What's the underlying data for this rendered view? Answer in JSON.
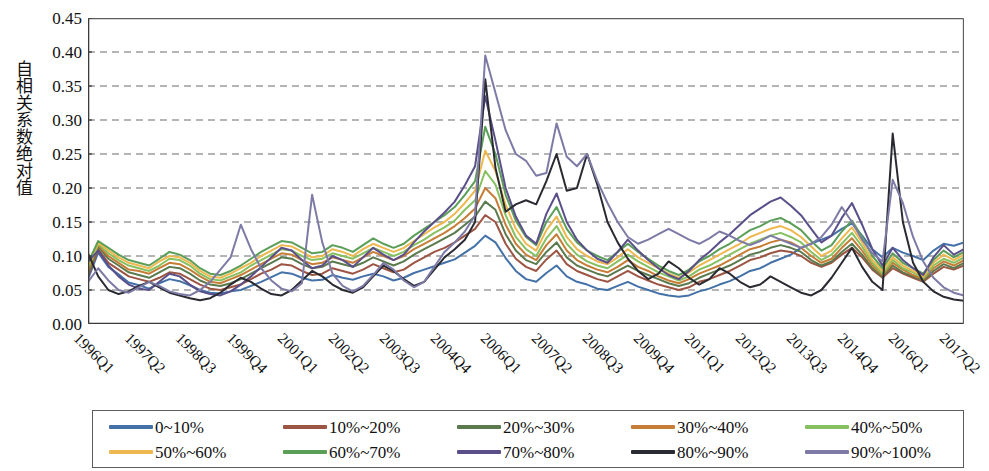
{
  "chart_data": {
    "type": "line",
    "title": "",
    "subtitle": "",
    "xlabel": "",
    "ylabel": "自相关系数绝对值",
    "ylim": [
      0.0,
      0.45
    ],
    "ytick_labels": [
      "0.45",
      "0.40",
      "0.35",
      "0.30",
      "0.25",
      "0.20",
      "0.15",
      "0.10",
      "0.05",
      "0.00"
    ],
    "ytick_values": [
      0.45,
      0.4,
      0.35,
      0.3,
      0.25,
      0.2,
      0.15,
      0.1,
      0.05,
      0.0
    ],
    "grid": "horizontal-dashed",
    "legend_position": "bottom",
    "legend_columns": 5,
    "x_tick_labels": [
      "1996Q1",
      "1997Q2",
      "1998Q3",
      "1999Q4",
      "2001Q1",
      "2002Q2",
      "2003Q3",
      "2004Q4",
      "2006Q1",
      "2007Q2",
      "2008Q3",
      "2009Q4",
      "2011Q1",
      "2012Q2",
      "2013Q3",
      "2014Q4",
      "2016Q1",
      "2017Q2"
    ],
    "x_tick_step_quarters": 5,
    "x_count": 87,
    "x_start": "1996Q1",
    "x_end": "2017Q3",
    "colors": {
      "0~10%": "#4472a8",
      "10%~20%": "#9c5543",
      "20%~30%": "#5a7a4e",
      "30%~40%": "#c67d35",
      "40%~50%": "#86c060",
      "50%~60%": "#eeb84f",
      "60%~70%": "#5a9e57",
      "70%~80%": "#5b4f8a",
      "80%~90%": "#2a2a33",
      "90%~100%": "#7d7ba6"
    },
    "series": [
      {
        "name": "0~10%",
        "color": "#4472a8",
        "values": [
          0.066,
          0.105,
          0.084,
          0.073,
          0.061,
          0.057,
          0.052,
          0.06,
          0.066,
          0.063,
          0.057,
          0.05,
          0.046,
          0.045,
          0.048,
          0.05,
          0.056,
          0.062,
          0.069,
          0.076,
          0.074,
          0.068,
          0.064,
          0.065,
          0.072,
          0.068,
          0.065,
          0.07,
          0.074,
          0.07,
          0.064,
          0.068,
          0.075,
          0.08,
          0.085,
          0.09,
          0.095,
          0.105,
          0.115,
          0.13,
          0.12,
          0.097,
          0.078,
          0.066,
          0.062,
          0.075,
          0.086,
          0.07,
          0.062,
          0.058,
          0.052,
          0.05,
          0.056,
          0.062,
          0.055,
          0.05,
          0.045,
          0.042,
          0.04,
          0.042,
          0.048,
          0.052,
          0.058,
          0.063,
          0.07,
          0.078,
          0.082,
          0.09,
          0.096,
          0.102,
          0.112,
          0.118,
          0.124,
          0.13,
          0.14,
          0.148,
          0.13,
          0.11,
          0.098,
          0.112,
          0.105,
          0.1,
          0.094,
          0.108,
          0.118,
          0.115,
          0.12
        ]
      },
      {
        "name": "10%~20%",
        "color": "#9c5543",
        "values": [
          0.07,
          0.11,
          0.09,
          0.08,
          0.07,
          0.066,
          0.062,
          0.068,
          0.076,
          0.074,
          0.066,
          0.058,
          0.052,
          0.05,
          0.054,
          0.058,
          0.066,
          0.074,
          0.08,
          0.088,
          0.086,
          0.078,
          0.072,
          0.074,
          0.082,
          0.078,
          0.074,
          0.08,
          0.088,
          0.082,
          0.076,
          0.08,
          0.09,
          0.098,
          0.106,
          0.112,
          0.12,
          0.13,
          0.14,
          0.16,
          0.15,
          0.118,
          0.096,
          0.084,
          0.078,
          0.095,
          0.108,
          0.088,
          0.078,
          0.072,
          0.066,
          0.062,
          0.07,
          0.078,
          0.07,
          0.064,
          0.058,
          0.054,
          0.05,
          0.054,
          0.062,
          0.066,
          0.072,
          0.078,
          0.086,
          0.094,
          0.098,
          0.104,
          0.108,
          0.106,
          0.1,
          0.09,
          0.084,
          0.09,
          0.102,
          0.112,
          0.098,
          0.08,
          0.068,
          0.082,
          0.074,
          0.068,
          0.062,
          0.074,
          0.084,
          0.08,
          0.086
        ]
      },
      {
        "name": "20%~30%",
        "color": "#5a7a4e",
        "values": [
          0.074,
          0.114,
          0.096,
          0.086,
          0.076,
          0.072,
          0.068,
          0.076,
          0.084,
          0.082,
          0.074,
          0.064,
          0.058,
          0.056,
          0.06,
          0.066,
          0.074,
          0.082,
          0.09,
          0.098,
          0.096,
          0.088,
          0.082,
          0.084,
          0.092,
          0.088,
          0.084,
          0.09,
          0.098,
          0.092,
          0.086,
          0.092,
          0.102,
          0.11,
          0.118,
          0.126,
          0.134,
          0.146,
          0.158,
          0.18,
          0.168,
          0.132,
          0.108,
          0.094,
          0.088,
          0.106,
          0.12,
          0.098,
          0.086,
          0.08,
          0.074,
          0.07,
          0.078,
          0.086,
          0.078,
          0.072,
          0.066,
          0.06,
          0.056,
          0.06,
          0.068,
          0.074,
          0.08,
          0.086,
          0.094,
          0.102,
          0.106,
          0.112,
          0.116,
          0.112,
          0.106,
          0.094,
          0.086,
          0.092,
          0.106,
          0.118,
          0.102,
          0.082,
          0.07,
          0.086,
          0.076,
          0.07,
          0.064,
          0.078,
          0.088,
          0.082,
          0.09
        ]
      },
      {
        "name": "30%~40%",
        "color": "#c67d35",
        "values": [
          0.078,
          0.116,
          0.1,
          0.09,
          0.08,
          0.078,
          0.074,
          0.082,
          0.09,
          0.088,
          0.08,
          0.07,
          0.062,
          0.06,
          0.066,
          0.072,
          0.08,
          0.088,
          0.096,
          0.104,
          0.102,
          0.094,
          0.088,
          0.09,
          0.098,
          0.094,
          0.09,
          0.098,
          0.106,
          0.1,
          0.094,
          0.1,
          0.11,
          0.118,
          0.126,
          0.134,
          0.144,
          0.156,
          0.17,
          0.2,
          0.185,
          0.146,
          0.118,
          0.102,
          0.094,
          0.116,
          0.132,
          0.108,
          0.094,
          0.086,
          0.08,
          0.076,
          0.084,
          0.094,
          0.084,
          0.078,
          0.07,
          0.064,
          0.06,
          0.066,
          0.074,
          0.08,
          0.086,
          0.094,
          0.102,
          0.11,
          0.114,
          0.12,
          0.124,
          0.12,
          0.112,
          0.1,
          0.09,
          0.096,
          0.112,
          0.126,
          0.108,
          0.086,
          0.072,
          0.09,
          0.08,
          0.072,
          0.066,
          0.082,
          0.092,
          0.086,
          0.094
        ]
      },
      {
        "name": "40%~50%",
        "color": "#86c060",
        "values": [
          0.082,
          0.118,
          0.104,
          0.094,
          0.086,
          0.082,
          0.078,
          0.086,
          0.096,
          0.094,
          0.086,
          0.074,
          0.066,
          0.064,
          0.07,
          0.076,
          0.086,
          0.094,
          0.102,
          0.11,
          0.108,
          0.1,
          0.094,
          0.096,
          0.104,
          0.1,
          0.096,
          0.104,
          0.112,
          0.106,
          0.1,
          0.106,
          0.116,
          0.124,
          0.134,
          0.142,
          0.152,
          0.168,
          0.182,
          0.225,
          0.205,
          0.16,
          0.128,
          0.11,
          0.1,
          0.126,
          0.144,
          0.118,
          0.102,
          0.092,
          0.086,
          0.082,
          0.092,
          0.102,
          0.092,
          0.084,
          0.076,
          0.07,
          0.064,
          0.07,
          0.08,
          0.086,
          0.094,
          0.102,
          0.11,
          0.118,
          0.124,
          0.13,
          0.134,
          0.128,
          0.12,
          0.106,
          0.094,
          0.102,
          0.118,
          0.134,
          0.114,
          0.09,
          0.074,
          0.094,
          0.082,
          0.076,
          0.068,
          0.086,
          0.096,
          0.09,
          0.098
        ]
      },
      {
        "name": "50%~60%",
        "color": "#eeb84f",
        "values": [
          0.086,
          0.12,
          0.108,
          0.098,
          0.09,
          0.086,
          0.082,
          0.092,
          0.1,
          0.098,
          0.09,
          0.078,
          0.07,
          0.068,
          0.074,
          0.082,
          0.09,
          0.1,
          0.108,
          0.116,
          0.114,
          0.106,
          0.098,
          0.1,
          0.11,
          0.106,
          0.1,
          0.11,
          0.118,
          0.112,
          0.106,
          0.112,
          0.122,
          0.132,
          0.142,
          0.15,
          0.162,
          0.178,
          0.196,
          0.255,
          0.225,
          0.175,
          0.14,
          0.118,
          0.108,
          0.138,
          0.158,
          0.128,
          0.11,
          0.1,
          0.092,
          0.088,
          0.098,
          0.11,
          0.098,
          0.09,
          0.082,
          0.074,
          0.068,
          0.076,
          0.086,
          0.094,
          0.102,
          0.11,
          0.118,
          0.128,
          0.134,
          0.14,
          0.144,
          0.138,
          0.128,
          0.114,
          0.1,
          0.108,
          0.126,
          0.142,
          0.12,
          0.094,
          0.078,
          0.098,
          0.086,
          0.078,
          0.07,
          0.09,
          0.102,
          0.094,
          0.102
        ]
      },
      {
        "name": "60%~70%",
        "color": "#5a9e57",
        "values": [
          0.09,
          0.122,
          0.112,
          0.102,
          0.094,
          0.09,
          0.086,
          0.096,
          0.106,
          0.102,
          0.094,
          0.082,
          0.074,
          0.072,
          0.078,
          0.086,
          0.096,
          0.106,
          0.114,
          0.122,
          0.12,
          0.112,
          0.104,
          0.106,
          0.116,
          0.112,
          0.106,
          0.116,
          0.126,
          0.118,
          0.112,
          0.118,
          0.13,
          0.14,
          0.15,
          0.16,
          0.172,
          0.19,
          0.21,
          0.29,
          0.25,
          0.19,
          0.152,
          0.128,
          0.116,
          0.15,
          0.172,
          0.14,
          0.12,
          0.108,
          0.1,
          0.094,
          0.106,
          0.118,
          0.106,
          0.096,
          0.086,
          0.078,
          0.072,
          0.08,
          0.092,
          0.1,
          0.11,
          0.118,
          0.128,
          0.138,
          0.144,
          0.152,
          0.156,
          0.148,
          0.138,
          0.122,
          0.108,
          0.116,
          0.136,
          0.152,
          0.128,
          0.1,
          0.082,
          0.104,
          0.09,
          0.082,
          0.074,
          0.094,
          0.108,
          0.098,
          0.106
        ]
      },
      {
        "name": "70%~80%",
        "color": "#5b4f8a",
        "values": [
          0.092,
          0.108,
          0.086,
          0.07,
          0.058,
          0.052,
          0.05,
          0.062,
          0.074,
          0.07,
          0.058,
          0.048,
          0.044,
          0.042,
          0.048,
          0.058,
          0.07,
          0.084,
          0.098,
          0.112,
          0.108,
          0.094,
          0.082,
          0.086,
          0.1,
          0.094,
          0.084,
          0.098,
          0.112,
          0.102,
          0.094,
          0.102,
          0.12,
          0.136,
          0.15,
          0.164,
          0.18,
          0.204,
          0.232,
          0.335,
          0.27,
          0.2,
          0.158,
          0.13,
          0.118,
          0.162,
          0.192,
          0.15,
          0.124,
          0.108,
          0.096,
          0.09,
          0.106,
          0.124,
          0.108,
          0.094,
          0.082,
          0.072,
          0.066,
          0.078,
          0.094,
          0.106,
          0.12,
          0.132,
          0.146,
          0.16,
          0.17,
          0.18,
          0.186,
          0.174,
          0.16,
          0.14,
          0.12,
          0.13,
          0.156,
          0.178,
          0.146,
          0.11,
          0.086,
          0.112,
          0.094,
          0.082,
          0.072,
          0.098,
          0.116,
          0.102,
          0.11
        ]
      },
      {
        "name": "80%~90%",
        "color": "#2a2a33",
        "values": [
          0.104,
          0.07,
          0.05,
          0.044,
          0.048,
          0.056,
          0.062,
          0.054,
          0.046,
          0.042,
          0.038,
          0.035,
          0.038,
          0.046,
          0.058,
          0.068,
          0.062,
          0.052,
          0.044,
          0.042,
          0.05,
          0.064,
          0.078,
          0.07,
          0.058,
          0.05,
          0.046,
          0.054,
          0.07,
          0.086,
          0.078,
          0.066,
          0.056,
          0.062,
          0.08,
          0.098,
          0.11,
          0.124,
          0.15,
          0.36,
          0.23,
          0.165,
          0.176,
          0.182,
          0.176,
          0.21,
          0.25,
          0.196,
          0.2,
          0.25,
          0.205,
          0.15,
          0.12,
          0.096,
          0.078,
          0.066,
          0.074,
          0.092,
          0.082,
          0.068,
          0.058,
          0.066,
          0.082,
          0.074,
          0.062,
          0.054,
          0.058,
          0.07,
          0.062,
          0.054,
          0.046,
          0.042,
          0.05,
          0.068,
          0.09,
          0.112,
          0.084,
          0.062,
          0.05,
          0.28,
          0.15,
          0.09,
          0.062,
          0.048,
          0.04,
          0.036,
          0.034
        ]
      },
      {
        "name": "90%~100%",
        "color": "#7d7ba6",
        "values": [
          0.062,
          0.082,
          0.064,
          0.05,
          0.046,
          0.054,
          0.062,
          0.056,
          0.048,
          0.044,
          0.042,
          0.05,
          0.062,
          0.08,
          0.098,
          0.146,
          0.11,
          0.082,
          0.064,
          0.052,
          0.048,
          0.06,
          0.19,
          0.12,
          0.074,
          0.056,
          0.048,
          0.056,
          0.072,
          0.09,
          0.08,
          0.064,
          0.054,
          0.062,
          0.084,
          0.106,
          0.12,
          0.136,
          0.16,
          0.395,
          0.34,
          0.285,
          0.25,
          0.24,
          0.218,
          0.222,
          0.295,
          0.246,
          0.232,
          0.25,
          0.21,
          0.178,
          0.15,
          0.128,
          0.118,
          0.124,
          0.132,
          0.14,
          0.132,
          0.124,
          0.118,
          0.126,
          0.136,
          0.13,
          0.122,
          0.116,
          0.122,
          0.13,
          0.124,
          0.118,
          0.112,
          0.118,
          0.128,
          0.146,
          0.172,
          0.15,
          0.124,
          0.104,
          0.092,
          0.212,
          0.178,
          0.128,
          0.092,
          0.068,
          0.054,
          0.046,
          0.042
        ]
      }
    ]
  },
  "legend": {
    "items": [
      {
        "label": "0~10%"
      },
      {
        "label": "10%~20%"
      },
      {
        "label": "20%~30%"
      },
      {
        "label": "30%~40%"
      },
      {
        "label": "40%~50%"
      },
      {
        "label": "50%~60%"
      },
      {
        "label": "60%~70%"
      },
      {
        "label": "70%~80%"
      },
      {
        "label": "80%~90%"
      },
      {
        "label": "90%~100%"
      }
    ]
  },
  "axis": {
    "y_title": "自相关系数绝对值"
  }
}
